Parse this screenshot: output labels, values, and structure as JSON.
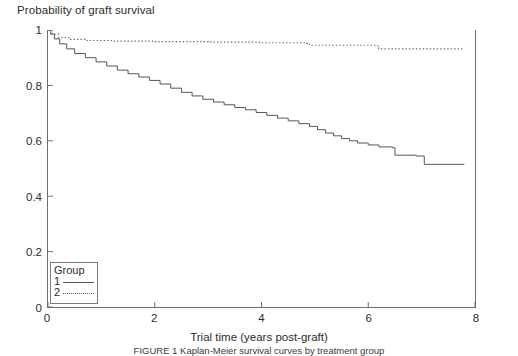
{
  "figure": {
    "y_axis_title": "Probability of graft survival",
    "x_axis_title": "Trial time (years post-graft)",
    "caption": "FIGURE 1   Kaplan-Meier survival curves by treatment group"
  },
  "legend": {
    "title": "Group",
    "entries": [
      {
        "key": "1",
        "style": "solid"
      },
      {
        "key": "2",
        "style": "dotted"
      }
    ]
  },
  "chart_data": {
    "type": "line",
    "title": "",
    "xlabel": "Trial time (years post-graft)",
    "ylabel": "Probability of graft survival",
    "xlim": [
      0,
      8
    ],
    "ylim": [
      0,
      1
    ],
    "xticks": [
      0,
      2,
      4,
      6,
      8
    ],
    "yticks": [
      0,
      0.2,
      0.4,
      0.6,
      0.8,
      1
    ],
    "xtick_labels": [
      "0",
      "2",
      "4",
      "6",
      "8"
    ],
    "ytick_labels": [
      "0",
      "0.2",
      "0.4",
      "0.6",
      "0.8",
      "1"
    ],
    "grid": false,
    "legend_position": "lower-left",
    "legend_title": "Group",
    "series": [
      {
        "name": "1",
        "line_style": "solid",
        "color": "#555555",
        "x": [
          0,
          0.05,
          0.12,
          0.22,
          0.35,
          0.5,
          0.7,
          0.9,
          1.1,
          1.3,
          1.5,
          1.7,
          1.9,
          2.1,
          2.3,
          2.5,
          2.7,
          2.9,
          3.1,
          3.3,
          3.5,
          3.7,
          3.9,
          4.1,
          4.3,
          4.5,
          4.7,
          4.9,
          5.05,
          5.2,
          5.35,
          5.5,
          5.65,
          5.8,
          6.0,
          6.2,
          6.45,
          6.5,
          6.9,
          7.0,
          7.05,
          7.8
        ],
        "y": [
          1.0,
          0.985,
          0.968,
          0.95,
          0.932,
          0.915,
          0.9,
          0.885,
          0.87,
          0.855,
          0.842,
          0.83,
          0.818,
          0.805,
          0.79,
          0.775,
          0.762,
          0.75,
          0.74,
          0.73,
          0.72,
          0.712,
          0.702,
          0.692,
          0.682,
          0.672,
          0.662,
          0.652,
          0.64,
          0.628,
          0.618,
          0.608,
          0.6,
          0.592,
          0.585,
          0.578,
          0.575,
          0.548,
          0.545,
          0.545,
          0.515,
          0.515
        ]
      },
      {
        "name": "2",
        "line_style": "dotted",
        "color": "#666666",
        "x": [
          0,
          0.08,
          0.2,
          0.4,
          0.7,
          1.2,
          2.0,
          3.0,
          4.0,
          4.85,
          4.9,
          6.15,
          6.2,
          7.8
        ],
        "y": [
          1.0,
          0.985,
          0.972,
          0.966,
          0.962,
          0.96,
          0.958,
          0.956,
          0.954,
          0.952,
          0.945,
          0.943,
          0.932,
          0.932
        ]
      }
    ]
  },
  "colors": {
    "axis": "#6e6e6e",
    "text": "#2b2b2b",
    "background": "#ffffff"
  }
}
